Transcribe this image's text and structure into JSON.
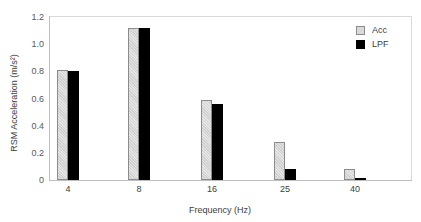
{
  "chart_data": {
    "type": "bar",
    "title": "",
    "xlabel": "Frequency (Hz)",
    "ylabel": "RSM Acceleration (m/s²)",
    "categories": [
      "4",
      "8",
      "16",
      "25",
      "40"
    ],
    "series": [
      {
        "name": "Acc",
        "values": [
          0.81,
          1.12,
          0.59,
          0.28,
          0.08
        ],
        "color": "#d9d9d9",
        "pattern": "hatched"
      },
      {
        "name": "LPF",
        "values": [
          0.8,
          1.12,
          0.56,
          0.08,
          0.015
        ],
        "color": "#000000"
      }
    ],
    "ylim": [
      0,
      1.2
    ],
    "yticks": [
      "0",
      "0.2",
      "0.4",
      "0.6",
      "0.8",
      "1.0",
      "1.2"
    ],
    "grid": false,
    "legend_position": "upper right"
  },
  "axis": {
    "ylabel": "RSM Acceleration (m/s²)",
    "xlabel": "Frequency (Hz)"
  },
  "legend": {
    "items": [
      {
        "label": "Acc"
      },
      {
        "label": "LPF"
      }
    ]
  }
}
